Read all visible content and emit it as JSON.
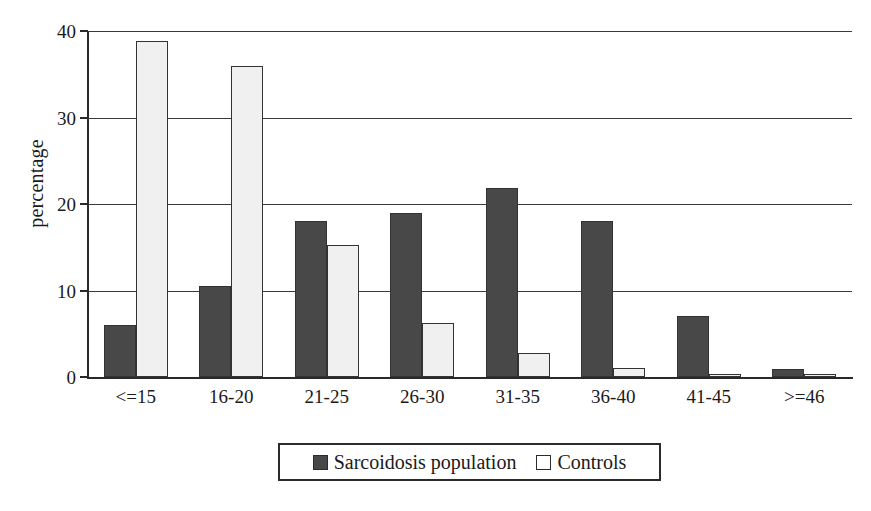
{
  "chart_data": {
    "type": "bar",
    "title": "",
    "subtitle": "",
    "xlabel": "",
    "ylabel": "percentage",
    "ylim": [
      0,
      40
    ],
    "yticks": [
      0,
      10,
      20,
      30,
      40
    ],
    "ytick_labels": [
      "0",
      "10",
      "20",
      "30",
      "40"
    ],
    "grid": true,
    "legend_position": "bottom-center",
    "categories": [
      "<=15",
      "16-20",
      "21-25",
      "26-30",
      "31-35",
      "36-40",
      "41-45",
      ">=46"
    ],
    "series": [
      {
        "name": "Sarcoidosis population",
        "color": "#484848",
        "values": [
          6.0,
          10.5,
          18.0,
          19.0,
          21.8,
          18.0,
          7.0,
          0.9
        ]
      },
      {
        "name": "Controls",
        "color": "#f0f0f0",
        "values": [
          38.8,
          36.0,
          15.3,
          6.2,
          2.8,
          1.0,
          0.4,
          0.3
        ]
      }
    ]
  },
  "legend": {
    "entries": [
      {
        "label": "Sarcoidosis population",
        "swatch": "dark-gray-swatch"
      },
      {
        "label": "Controls",
        "swatch": "white-swatch"
      }
    ]
  }
}
